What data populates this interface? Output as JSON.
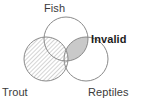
{
  "figure": {
    "type": "venn-diagram",
    "background_color": "#ffffff",
    "stroke_color": "#8a8a8a",
    "hatch_color": "#b4b4b4",
    "lens_fill_color": "#c9c9c9",
    "label_color": "#3a3a3a",
    "emphasis_color": "#1d1d1d"
  },
  "labels": {
    "fish": "Fish",
    "trout": "Trout",
    "reptiles": "Reptiles",
    "invalid": "Invalid"
  },
  "sets": [
    {
      "id": "fish",
      "name": "Fish",
      "cx": 66,
      "cy": 39,
      "r": 22,
      "fill": "none",
      "label_position": "top"
    },
    {
      "id": "trout",
      "name": "Trout",
      "cx": 46,
      "cy": 59,
      "r": 22,
      "fill": "hatched",
      "label_position": "bottom-left"
    },
    {
      "id": "reptiles",
      "name": "Reptiles",
      "cx": 86,
      "cy": 59,
      "r": 22,
      "fill": "none",
      "label_position": "bottom-right"
    }
  ],
  "regions": [
    {
      "id": "trout-only",
      "sets": [
        "trout"
      ],
      "fill": "hatched"
    },
    {
      "id": "trout-and-fish",
      "sets": [
        "trout",
        "fish"
      ],
      "fill": "hatched"
    },
    {
      "id": "trout-and-reptiles",
      "sets": [
        "trout",
        "reptiles"
      ],
      "fill": "hatched"
    },
    {
      "id": "trout-fish-reptiles",
      "sets": [
        "trout",
        "fish",
        "reptiles"
      ],
      "fill": "hatched"
    },
    {
      "id": "fish-and-reptiles",
      "sets": [
        "fish",
        "reptiles"
      ],
      "fill": "solid-gray",
      "annotation": "Invalid"
    }
  ],
  "annotations": [
    {
      "id": "invalid-callout",
      "text": "Invalid",
      "bold": true,
      "refers_to_region": "fish-and-reptiles",
      "x": 91,
      "y": 33
    }
  ]
}
